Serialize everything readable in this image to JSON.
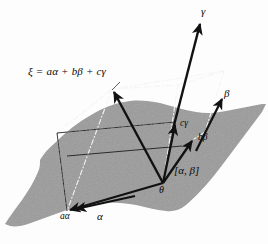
{
  "figure": {
    "background_color": "#fdfdfd",
    "plane_fill_color": "#9a9a9a",
    "line_color": "#111111",
    "dash_color": "#f2f2f2"
  },
  "labels": {
    "equation": "ξ = aα + bβ + cγ",
    "gamma_axis": "γ",
    "beta_axis": "β",
    "alpha_axis": "α",
    "c_gamma": "cγ",
    "b_beta": "bβ",
    "a_alpha": "aα",
    "origin": "θ",
    "plane_label": "[α, β]"
  },
  "geometry": {
    "origin": [
      163,
      183
    ],
    "a_alpha_tip": [
      67,
      211
    ],
    "b_beta_tip": [
      194,
      139
    ],
    "c_gamma_tip": [
      175,
      122
    ],
    "xi_tip": [
      112,
      89
    ],
    "gamma_arrow_tip": [
      200,
      21
    ],
    "beta_arrow_tip": [
      222,
      96
    ],
    "parallelepiped_top_right": [
      224,
      71
    ],
    "parallelepiped_top_mid": [
      178,
      85
    ]
  },
  "vectors": [
    {
      "name": "a-alpha",
      "label": "aα",
      "style": "solid-arrow"
    },
    {
      "name": "b-beta",
      "label": "bβ",
      "style": "solid-arrow"
    },
    {
      "name": "c-gamma",
      "label": "cγ",
      "style": "solid-arrow"
    },
    {
      "name": "xi",
      "label": "ξ",
      "style": "solid-arrow"
    },
    {
      "name": "gamma-basis",
      "label": "γ",
      "style": "solid-arrow"
    },
    {
      "name": "beta-basis",
      "label": "β",
      "style": "solid-arrow"
    },
    {
      "name": "alpha-basis",
      "label": "α",
      "style": "solid-arrow"
    }
  ]
}
